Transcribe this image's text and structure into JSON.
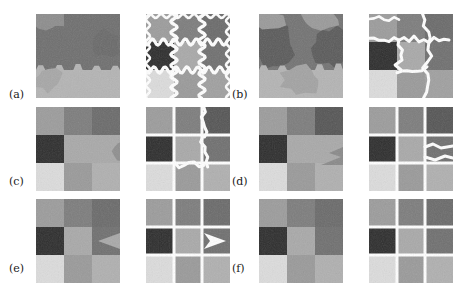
{
  "figure": {
    "type": "image-segmentation-results-grid",
    "caption_labels": [
      "(a)",
      "(b)",
      "(c)",
      "(d)",
      "(e)",
      "(f)"
    ],
    "background_color": "#ffffff",
    "boundary_color": "#ffffff",
    "columns_per_group": 2,
    "column_roles": [
      "noisy-mosaic-image",
      "segmentation-with-boundaries"
    ],
    "rows": 3,
    "groups_per_row": 2,
    "panel_size_px": 84,
    "gray_palette": {
      "g1": "#2e2e2e",
      "g2": "#3f3f3f",
      "g3": "#555555",
      "g4": "#6b6b6b",
      "g5": "#7d7d7d",
      "g6": "#8d8d8d",
      "g7": "#9c9c9c",
      "g8": "#ababab",
      "g9": "#bdbdbd",
      "g10": "#d2d2d2",
      "g11": "#e2e2e2"
    },
    "labels": [
      {
        "id": "a",
        "text": "(a)",
        "x": 9,
        "y": 89
      },
      {
        "id": "b",
        "text": "(b)",
        "x": 232,
        "y": 89
      },
      {
        "id": "c",
        "text": "(c)",
        "x": 9,
        "y": 176
      },
      {
        "id": "d",
        "text": "(d)",
        "x": 232,
        "y": 176
      },
      {
        "id": "e",
        "text": "(e)",
        "x": 9,
        "y": 263
      },
      {
        "id": "f",
        "text": "(f)",
        "x": 232,
        "y": 263
      }
    ],
    "panels": [
      {
        "id": "a-left",
        "name": "panel-a-image",
        "x": 36,
        "y": 14,
        "w": 84,
        "h": 84,
        "description": "Noisy image: dark gray upper region over light gray lower region with jagged hexagonal boundary",
        "role": "noisy-mosaic-image",
        "cells": [
          {
            "x": 0,
            "y": 0,
            "w": 84,
            "h": 56,
            "gray": "#6f6f6f"
          },
          {
            "x": 0,
            "y": 0,
            "w": 28,
            "h": 12,
            "gray": "#8d8d8d"
          },
          {
            "x": 0,
            "y": 56,
            "w": 84,
            "h": 28,
            "gray": "#b4b4b4"
          }
        ],
        "boundaries": []
      },
      {
        "id": "a-right",
        "name": "panel-a-segmentation",
        "x": 146,
        "y": 14,
        "w": 84,
        "h": 84,
        "description": "3x3 grid of gray blocks with wavy white segmentation boundaries over all internal edges",
        "role": "segmentation-with-boundaries",
        "cells": [
          {
            "x": 0,
            "y": 0,
            "w": 28,
            "h": 28,
            "gray": "#9c9c9c"
          },
          {
            "x": 28,
            "y": 0,
            "w": 28,
            "h": 28,
            "gray": "#7d7d7d"
          },
          {
            "x": 56,
            "y": 0,
            "w": 28,
            "h": 28,
            "gray": "#6b6b6b"
          },
          {
            "x": 0,
            "y": 28,
            "w": 28,
            "h": 28,
            "gray": "#2e2e2e"
          },
          {
            "x": 28,
            "y": 28,
            "w": 28,
            "h": 28,
            "gray": "#a9a9a9"
          },
          {
            "x": 56,
            "y": 28,
            "w": 28,
            "h": 28,
            "gray": "#707070"
          },
          {
            "x": 0,
            "y": 56,
            "w": 28,
            "h": 28,
            "gray": "#dcdcdc"
          },
          {
            "x": 28,
            "y": 56,
            "w": 28,
            "h": 28,
            "gray": "#9a9a9a"
          },
          {
            "x": 56,
            "y": 56,
            "w": 28,
            "h": 28,
            "gray": "#a0a0a0"
          }
        ],
        "boundary_style": "wavy-sinusoidal-full-grid"
      },
      {
        "id": "b-left",
        "name": "panel-b-image",
        "x": 259,
        "y": 14,
        "w": 84,
        "h": 84,
        "description": "Noisy image: interlocking medium and dark gray blobs above a light gray band",
        "role": "noisy-mosaic-image",
        "cells": [
          {
            "x": 0,
            "y": 0,
            "w": 84,
            "h": 56,
            "gray": "#6f6f6f"
          },
          {
            "x": 0,
            "y": 0,
            "w": 30,
            "h": 14,
            "gray": "#8d8d8d"
          },
          {
            "x": 0,
            "y": 56,
            "w": 84,
            "h": 28,
            "gray": "#b4b4b4"
          }
        ],
        "boundaries": []
      },
      {
        "id": "b-right",
        "name": "panel-b-segmentation",
        "x": 369,
        "y": 14,
        "w": 84,
        "h": 84,
        "description": "3x3 gray blocks with irregular jagged white boundaries, some merged regions",
        "role": "segmentation-with-boundaries",
        "cells": [
          {
            "x": 0,
            "y": 0,
            "w": 28,
            "h": 28,
            "gray": "#9c9c9c"
          },
          {
            "x": 28,
            "y": 0,
            "w": 28,
            "h": 28,
            "gray": "#7d7d7d"
          },
          {
            "x": 56,
            "y": 0,
            "w": 28,
            "h": 28,
            "gray": "#6b6b6b"
          },
          {
            "x": 0,
            "y": 28,
            "w": 28,
            "h": 28,
            "gray": "#2e2e2e"
          },
          {
            "x": 28,
            "y": 28,
            "w": 28,
            "h": 28,
            "gray": "#a9a9a9"
          },
          {
            "x": 56,
            "y": 28,
            "w": 28,
            "h": 28,
            "gray": "#707070"
          },
          {
            "x": 0,
            "y": 56,
            "w": 28,
            "h": 28,
            "gray": "#dcdcdc"
          },
          {
            "x": 28,
            "y": 56,
            "w": 28,
            "h": 28,
            "gray": "#9a9a9a"
          },
          {
            "x": 56,
            "y": 56,
            "w": 28,
            "h": 28,
            "gray": "#a0a0a0"
          }
        ],
        "boundary_style": "jagged-partial-grid"
      },
      {
        "id": "c-left",
        "name": "panel-c-image",
        "x": 36,
        "y": 107,
        "w": 84,
        "h": 84,
        "description": "Noisy blocky image, merged mid-gray region spanning centre-right",
        "role": "noisy-mosaic-image",
        "cells": [
          {
            "x": 0,
            "y": 0,
            "w": 28,
            "h": 28,
            "gray": "#9c9c9c"
          },
          {
            "x": 28,
            "y": 0,
            "w": 28,
            "h": 28,
            "gray": "#7d7d7d"
          },
          {
            "x": 56,
            "y": 0,
            "w": 28,
            "h": 28,
            "gray": "#6b6b6b"
          },
          {
            "x": 0,
            "y": 28,
            "w": 28,
            "h": 28,
            "gray": "#2e2e2e"
          },
          {
            "x": 28,
            "y": 28,
            "w": 56,
            "h": 28,
            "gray": "#a9a9a9"
          },
          {
            "x": 0,
            "y": 56,
            "w": 28,
            "h": 28,
            "gray": "#dcdcdc"
          },
          {
            "x": 28,
            "y": 56,
            "w": 28,
            "h": 28,
            "gray": "#9a9a9a"
          },
          {
            "x": 56,
            "y": 56,
            "w": 28,
            "h": 28,
            "gray": "#b0b0b0"
          }
        ],
        "boundaries": []
      },
      {
        "id": "c-right",
        "name": "panel-c-segmentation",
        "x": 146,
        "y": 107,
        "w": 84,
        "h": 84,
        "description": "3x3 grid with straight white gaps plus jagged boundary in right column and centre",
        "role": "segmentation-with-boundaries",
        "cells": [
          {
            "x": 0,
            "y": 0,
            "w": 28,
            "h": 28,
            "gray": "#9c9c9c"
          },
          {
            "x": 28,
            "y": 0,
            "w": 28,
            "h": 28,
            "gray": "#7d7d7d"
          },
          {
            "x": 56,
            "y": 0,
            "w": 28,
            "h": 28,
            "gray": "#565656"
          },
          {
            "x": 0,
            "y": 28,
            "w": 28,
            "h": 28,
            "gray": "#2e2e2e"
          },
          {
            "x": 28,
            "y": 28,
            "w": 28,
            "h": 28,
            "gray": "#a9a9a9"
          },
          {
            "x": 56,
            "y": 28,
            "w": 28,
            "h": 28,
            "gray": "#707070"
          },
          {
            "x": 0,
            "y": 56,
            "w": 28,
            "h": 28,
            "gray": "#dcdcdc"
          },
          {
            "x": 28,
            "y": 56,
            "w": 28,
            "h": 28,
            "gray": "#9a9a9a"
          },
          {
            "x": 56,
            "y": 56,
            "w": 28,
            "h": 28,
            "gray": "#b0b0b0"
          }
        ],
        "boundary_style": "straight-grid-with-jagged-right"
      },
      {
        "id": "d-left",
        "name": "panel-d-image",
        "x": 259,
        "y": 107,
        "w": 84,
        "h": 84,
        "description": "Noisy blocky image with merged mid region and small notch on right",
        "role": "noisy-mosaic-image",
        "cells": [
          {
            "x": 0,
            "y": 0,
            "w": 28,
            "h": 28,
            "gray": "#9c9c9c"
          },
          {
            "x": 28,
            "y": 0,
            "w": 28,
            "h": 28,
            "gray": "#7d7d7d"
          },
          {
            "x": 56,
            "y": 0,
            "w": 28,
            "h": 28,
            "gray": "#565656"
          },
          {
            "x": 0,
            "y": 28,
            "w": 28,
            "h": 28,
            "gray": "#2e2e2e"
          },
          {
            "x": 28,
            "y": 28,
            "w": 56,
            "h": 28,
            "gray": "#a9a9a9"
          },
          {
            "x": 0,
            "y": 56,
            "w": 28,
            "h": 28,
            "gray": "#dcdcdc"
          },
          {
            "x": 28,
            "y": 56,
            "w": 28,
            "h": 28,
            "gray": "#9a9a9a"
          },
          {
            "x": 56,
            "y": 56,
            "w": 28,
            "h": 28,
            "gray": "#b0b0b0"
          }
        ],
        "boundaries": []
      },
      {
        "id": "d-right",
        "name": "panel-d-segmentation",
        "x": 369,
        "y": 107,
        "w": 84,
        "h": 84,
        "description": "3x3 grid, nearly straight white separators, one wavy boundary at middle-right",
        "role": "segmentation-with-boundaries",
        "cells": [
          {
            "x": 0,
            "y": 0,
            "w": 28,
            "h": 28,
            "gray": "#9c9c9c"
          },
          {
            "x": 28,
            "y": 0,
            "w": 28,
            "h": 28,
            "gray": "#7d7d7d"
          },
          {
            "x": 56,
            "y": 0,
            "w": 28,
            "h": 28,
            "gray": "#565656"
          },
          {
            "x": 0,
            "y": 28,
            "w": 28,
            "h": 28,
            "gray": "#2e2e2e"
          },
          {
            "x": 28,
            "y": 28,
            "w": 28,
            "h": 28,
            "gray": "#a9a9a9"
          },
          {
            "x": 56,
            "y": 28,
            "w": 28,
            "h": 28,
            "gray": "#707070"
          },
          {
            "x": 0,
            "y": 56,
            "w": 28,
            "h": 28,
            "gray": "#dcdcdc"
          },
          {
            "x": 28,
            "y": 56,
            "w": 28,
            "h": 28,
            "gray": "#9a9a9a"
          },
          {
            "x": 56,
            "y": 56,
            "w": 28,
            "h": 28,
            "gray": "#b0b0b0"
          }
        ],
        "boundary_style": "straight-grid-with-one-wave"
      },
      {
        "id": "e-left",
        "name": "panel-e-image",
        "x": 36,
        "y": 199,
        "w": 84,
        "h": 84,
        "description": "Noisy blocky image with arrow-like notch on middle-right cell",
        "role": "noisy-mosaic-image",
        "cells": [
          {
            "x": 0,
            "y": 0,
            "w": 28,
            "h": 28,
            "gray": "#9c9c9c"
          },
          {
            "x": 28,
            "y": 0,
            "w": 28,
            "h": 28,
            "gray": "#7d7d7d"
          },
          {
            "x": 56,
            "y": 0,
            "w": 28,
            "h": 28,
            "gray": "#6b6b6b"
          },
          {
            "x": 0,
            "y": 28,
            "w": 28,
            "h": 28,
            "gray": "#2e2e2e"
          },
          {
            "x": 28,
            "y": 28,
            "w": 28,
            "h": 28,
            "gray": "#a9a9a9"
          },
          {
            "x": 56,
            "y": 28,
            "w": 28,
            "h": 28,
            "gray": "#707070"
          },
          {
            "x": 0,
            "y": 56,
            "w": 28,
            "h": 28,
            "gray": "#dcdcdc"
          },
          {
            "x": 28,
            "y": 56,
            "w": 28,
            "h": 28,
            "gray": "#9a9a9a"
          },
          {
            "x": 56,
            "y": 56,
            "w": 28,
            "h": 28,
            "gray": "#b0b0b0"
          }
        ],
        "boundaries": []
      },
      {
        "id": "e-right",
        "name": "panel-e-segmentation",
        "x": 146,
        "y": 199,
        "w": 84,
        "h": 84,
        "description": "3x3 grid with straight white separators and a white arrow-shaped artefact at middle-right",
        "role": "segmentation-with-boundaries",
        "cells": [
          {
            "x": 0,
            "y": 0,
            "w": 28,
            "h": 28,
            "gray": "#9c9c9c"
          },
          {
            "x": 28,
            "y": 0,
            "w": 28,
            "h": 28,
            "gray": "#7d7d7d"
          },
          {
            "x": 56,
            "y": 0,
            "w": 28,
            "h": 28,
            "gray": "#6b6b6b"
          },
          {
            "x": 0,
            "y": 28,
            "w": 28,
            "h": 28,
            "gray": "#2e2e2e"
          },
          {
            "x": 28,
            "y": 28,
            "w": 28,
            "h": 28,
            "gray": "#a9a9a9"
          },
          {
            "x": 56,
            "y": 28,
            "w": 28,
            "h": 28,
            "gray": "#707070"
          },
          {
            "x": 0,
            "y": 56,
            "w": 28,
            "h": 28,
            "gray": "#dcdcdc"
          },
          {
            "x": 28,
            "y": 56,
            "w": 28,
            "h": 28,
            "gray": "#9a9a9a"
          },
          {
            "x": 56,
            "y": 56,
            "w": 28,
            "h": 28,
            "gray": "#b0b0b0"
          }
        ],
        "boundary_style": "straight-grid-with-arrow"
      },
      {
        "id": "f-left",
        "name": "panel-f-image",
        "x": 259,
        "y": 199,
        "w": 84,
        "h": 84,
        "description": "Clean noisy 3x3 checker mosaic, no white boundaries",
        "role": "noisy-mosaic-image",
        "cells": [
          {
            "x": 0,
            "y": 0,
            "w": 28,
            "h": 28,
            "gray": "#9c9c9c"
          },
          {
            "x": 28,
            "y": 0,
            "w": 28,
            "h": 28,
            "gray": "#7d7d7d"
          },
          {
            "x": 56,
            "y": 0,
            "w": 28,
            "h": 28,
            "gray": "#6b6b6b"
          },
          {
            "x": 0,
            "y": 28,
            "w": 28,
            "h": 28,
            "gray": "#2e2e2e"
          },
          {
            "x": 28,
            "y": 28,
            "w": 28,
            "h": 28,
            "gray": "#a9a9a9"
          },
          {
            "x": 56,
            "y": 28,
            "w": 28,
            "h": 28,
            "gray": "#707070"
          },
          {
            "x": 0,
            "y": 56,
            "w": 28,
            "h": 28,
            "gray": "#dcdcdc"
          },
          {
            "x": 28,
            "y": 56,
            "w": 28,
            "h": 28,
            "gray": "#9a9a9a"
          },
          {
            "x": 56,
            "y": 56,
            "w": 28,
            "h": 28,
            "gray": "#b0b0b0"
          }
        ],
        "boundaries": []
      },
      {
        "id": "f-right",
        "name": "panel-f-segmentation",
        "x": 369,
        "y": 199,
        "w": 84,
        "h": 84,
        "description": "3x3 grid fully separated by clean straight white boundaries — perfect segmentation",
        "role": "segmentation-with-boundaries",
        "cells": [
          {
            "x": 0,
            "y": 0,
            "w": 28,
            "h": 28,
            "gray": "#9c9c9c"
          },
          {
            "x": 28,
            "y": 0,
            "w": 28,
            "h": 28,
            "gray": "#7d7d7d"
          },
          {
            "x": 56,
            "y": 0,
            "w": 28,
            "h": 28,
            "gray": "#6b6b6b"
          },
          {
            "x": 0,
            "y": 28,
            "w": 28,
            "h": 28,
            "gray": "#2e2e2e"
          },
          {
            "x": 28,
            "y": 28,
            "w": 28,
            "h": 28,
            "gray": "#a9a9a9"
          },
          {
            "x": 56,
            "y": 28,
            "w": 28,
            "h": 28,
            "gray": "#707070"
          },
          {
            "x": 0,
            "y": 56,
            "w": 28,
            "h": 28,
            "gray": "#dcdcdc"
          },
          {
            "x": 28,
            "y": 56,
            "w": 28,
            "h": 28,
            "gray": "#9a9a9a"
          },
          {
            "x": 56,
            "y": 56,
            "w": 28,
            "h": 28,
            "gray": "#b0b0b0"
          }
        ],
        "boundary_style": "clean-straight-grid"
      }
    ]
  }
}
